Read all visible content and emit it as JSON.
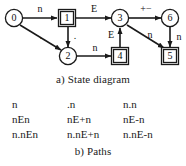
{
  "figure": {
    "part_a": {
      "caption_tag": "a)",
      "caption_text": "State diagram",
      "nodes": [
        {
          "id": "0",
          "label": "0",
          "shape": "circle",
          "cx": 14,
          "cy": 18
        },
        {
          "id": "1",
          "label": "1",
          "shape": "square",
          "cx": 67,
          "cy": 18
        },
        {
          "id": "3",
          "label": "3",
          "shape": "circle",
          "cx": 120,
          "cy": 18
        },
        {
          "id": "6",
          "label": "6",
          "shape": "circle",
          "cx": 170,
          "cy": 18
        },
        {
          "id": "2",
          "label": "2",
          "shape": "circle",
          "cx": 68,
          "cy": 56
        },
        {
          "id": "4",
          "label": "4",
          "shape": "square",
          "cx": 120,
          "cy": 56
        },
        {
          "id": "5",
          "label": "5",
          "shape": "square",
          "cx": 170,
          "cy": 56
        }
      ],
      "edges": [
        {
          "from": "0",
          "to": "1",
          "label": "n",
          "label_x": 40,
          "label_y": 9
        },
        {
          "from": "0",
          "to": "2",
          "label": ".",
          "label_x": 41,
          "label_y": 36
        },
        {
          "from": "1",
          "to": "2",
          "label": ".",
          "label_x": 74,
          "label_y": 36
        },
        {
          "from": "1",
          "to": "3",
          "label": "E",
          "label_x": 94,
          "label_y": 9
        },
        {
          "from": "2",
          "to": "4",
          "label": "n",
          "label_x": 95,
          "label_y": 49
        },
        {
          "from": "4",
          "to": "3",
          "label": "E",
          "label_x": 111,
          "label_y": 35
        },
        {
          "from": "3",
          "to": "6",
          "label": "+−",
          "label_x": 146,
          "label_y": 9
        },
        {
          "from": "3",
          "to": "5",
          "label": "n",
          "label_x": 151,
          "label_y": 36
        },
        {
          "from": "6",
          "to": "5",
          "label": "n",
          "label_x": 179,
          "label_y": 38
        }
      ]
    },
    "part_b": {
      "caption_tag": "b)",
      "caption_text": "Paths",
      "rows": [
        [
          "n",
          ".n",
          "n.n"
        ],
        [
          "nEn",
          "nE+n",
          "nE-n"
        ],
        [
          "n.nEn",
          "n.nE+n",
          "n.nE-n"
        ]
      ]
    }
  }
}
